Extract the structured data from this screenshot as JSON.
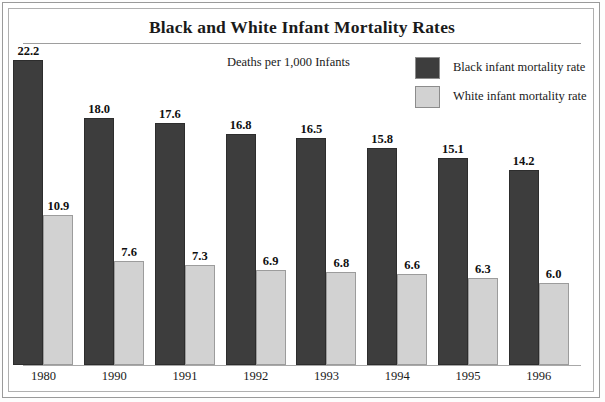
{
  "frame": {
    "border_color": "#9a9a9a",
    "inner_border_color": "#b0b0b0"
  },
  "chart_data": {
    "type": "bar",
    "title": "Black and White Infant Mortality Rates",
    "subtitle": "Deaths per 1,000 Infants",
    "xlabel": "",
    "ylabel": "Deaths per 1,000 Infants",
    "ylim": [
      0,
      23
    ],
    "grid": false,
    "legend_position": "top-right",
    "categories": [
      "1980",
      "1990",
      "1991",
      "1992",
      "1993",
      "1994",
      "1995",
      "1996"
    ],
    "series": [
      {
        "name": "Black infant mortality rate",
        "color": "#3d3d3d",
        "values": [
          22.2,
          18.0,
          17.6,
          16.8,
          16.5,
          15.8,
          15.1,
          14.2
        ],
        "labels": [
          "22.2",
          "18.0",
          "17.6",
          "16.8",
          "16.5",
          "15.8",
          "15.1",
          "14.2"
        ]
      },
      {
        "name": "White infant mortality rate",
        "color": "#d2d2d2",
        "values": [
          10.9,
          7.6,
          7.3,
          6.9,
          6.8,
          6.6,
          6.3,
          6.0
        ],
        "labels": [
          "10.9",
          "7.6",
          "7.3",
          "6.9",
          "6.8",
          "6.6",
          "6.3",
          "6.0"
        ]
      }
    ]
  },
  "legend": {
    "items": [
      {
        "label": "Black infant mortality rate",
        "color": "#3d3d3d"
      },
      {
        "label": "White infant mortality rate",
        "color": "#d2d2d2"
      }
    ]
  }
}
